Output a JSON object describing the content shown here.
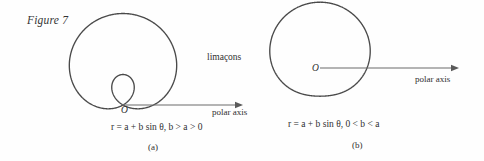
{
  "figure": {
    "caption": "Figure 7",
    "family_name": "limaçons"
  },
  "panels": [
    {
      "id": "a",
      "panel_label": "(a)",
      "origin_label": "O",
      "axis_label": "polar axis",
      "equation_text": "r = a + b sin θ, b > a > 0",
      "equation_parts": {
        "lhs": "r",
        "eq": "=",
        "rhs": "a + b sin θ",
        "condition": "b > a > 0"
      },
      "curve_type": "limaçon with inner loop"
    },
    {
      "id": "b",
      "panel_label": "(b)",
      "origin_label": "O",
      "axis_label": "polar axis",
      "equation_text": "r = a + b sin θ, 0 < b < a",
      "equation_parts": {
        "lhs": "r",
        "eq": "=",
        "rhs": "a + b sin θ",
        "condition": "0 < b < a"
      },
      "curve_type": "dimpled limaçon"
    }
  ],
  "chart_data": {
    "type": "line",
    "title": "Figure 7",
    "subtitle": "limaçons",
    "coordinate_system": "polar",
    "grid": false,
    "legend": null,
    "plots": [
      {
        "name": "(a) limaçon with inner loop",
        "equation": "r = a + b sin θ",
        "condition": "b > a > 0",
        "params": {
          "a": 1,
          "b": 2
        },
        "theta_range_deg": [
          0,
          360
        ],
        "origin_px": [
          123,
          105
        ],
        "scale_px_per_unit": 30.5,
        "axis": {
          "name": "polar axis",
          "from_px": [
            123,
            105
          ],
          "to_px": [
            243,
            105
          ],
          "direction": "right"
        }
      },
      {
        "name": "(b) dimpled limaçon",
        "equation": "r = a + b sin θ",
        "condition": "0 < b < a",
        "params": {
          "a": 2,
          "b": 0.8
        },
        "theta_range_deg": [
          0,
          360
        ],
        "origin_px": [
          320,
          68
        ],
        "scale_px_per_unit": 23.5,
        "axis": {
          "name": "polar axis",
          "from_px": [
            320,
            68
          ],
          "to_px": [
            459,
            68
          ],
          "direction": "right"
        }
      }
    ]
  },
  "colors": {
    "background": "#fefefe",
    "curve": "#4a4a4a",
    "axis": "#6b6b6b",
    "text": "#2f2f2f"
  }
}
